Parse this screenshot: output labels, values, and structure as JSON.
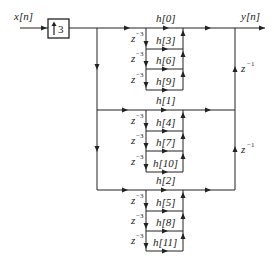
{
  "diagram": {
    "type": "polyphase FIR interpolator signal-flow graph",
    "input_label": "x[n]",
    "output_label": "y[n]",
    "upsampler": {
      "label": "3",
      "symbol": "up-arrow"
    },
    "delay_inner": "z",
    "delay_inner_exp": "−3",
    "delay_outer": "z",
    "delay_outer_exp": "−1",
    "groups": [
      {
        "coeffs": [
          "h[0]",
          "h[3]",
          "h[6]",
          "h[9]"
        ]
      },
      {
        "coeffs": [
          "h[1]",
          "h[4]",
          "h[7]",
          "h[10]"
        ]
      },
      {
        "coeffs": [
          "h[2]",
          "h[5]",
          "h[8]",
          "h[11]"
        ]
      }
    ]
  }
}
